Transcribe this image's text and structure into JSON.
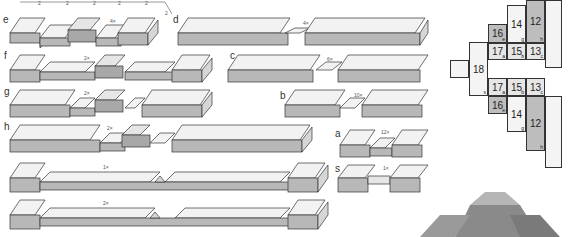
{
  "title": "",
  "dimension_marks": [
    "2",
    "2",
    "2",
    "2",
    "2",
    "2",
    "2",
    "1"
  ],
  "pieces": [
    {
      "id": "e",
      "label": "e",
      "count": "4×"
    },
    {
      "id": "d",
      "label": "d",
      "count": "4×"
    },
    {
      "id": "f",
      "label": "f",
      "count": "2×"
    },
    {
      "id": "c",
      "label": "c",
      "count": "6×"
    },
    {
      "id": "g",
      "label": "g",
      "count": "2×"
    },
    {
      "id": "b",
      "label": "b",
      "count": "10×"
    },
    {
      "id": "h",
      "label": "h",
      "count": "2×"
    },
    {
      "id": "a",
      "label": "a",
      "count": "12×"
    },
    {
      "id": "long1",
      "label": "",
      "count": "1×"
    },
    {
      "id": "s",
      "label": "s",
      "count": "1×"
    },
    {
      "id": "long2",
      "label": "",
      "count": "2×"
    }
  ],
  "grid": {
    "cells": [
      {
        "text": "16",
        "sub": "e"
      },
      {
        "text": "14",
        "sub": "g"
      },
      {
        "text": "12",
        "sub": "h"
      },
      {
        "text": "18",
        "sub": "s"
      },
      {
        "text": "17",
        "sub": "a"
      },
      {
        "text": "15",
        "sub": "b"
      },
      {
        "text": "13",
        "sub": "c"
      },
      {
        "text": "17",
        "sub": "a"
      },
      {
        "text": "15",
        "sub": "b"
      },
      {
        "text": "13",
        "sub": "c"
      },
      {
        "text": "16",
        "sub": "e"
      },
      {
        "text": "14",
        "sub": "g"
      },
      {
        "text": "12",
        "sub": "h"
      }
    ]
  },
  "colors": {
    "top": "#f2f2f2",
    "front": "#b8b8b8",
    "side": "#d6d6d6",
    "line": "#333333"
  }
}
